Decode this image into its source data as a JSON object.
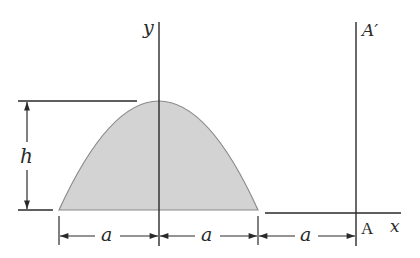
{
  "diagram": {
    "type": "parabolic-area-figure",
    "shape": {
      "name": "parabolic spandrel area",
      "fill": "#d3d3d3",
      "stroke": "#8a8a8a"
    },
    "labels": {
      "y_axis": "y",
      "x_axis": "x",
      "point_A": "A",
      "point_A_prime": "A′",
      "height": "h",
      "dim_1": "a",
      "dim_2": "a",
      "dim_3": "a"
    },
    "dimensions": [
      {
        "label": "h",
        "description": "height of parabola"
      },
      {
        "label": "a",
        "description": "left half base"
      },
      {
        "label": "a",
        "description": "right half base"
      },
      {
        "label": "a",
        "description": "distance from base end to axis AA′"
      }
    ],
    "colors": {
      "line": "#2a2a2a",
      "area_fill": "#d3d3d3",
      "area_edge": "#8a8a8a",
      "background": "#ffffff"
    }
  }
}
